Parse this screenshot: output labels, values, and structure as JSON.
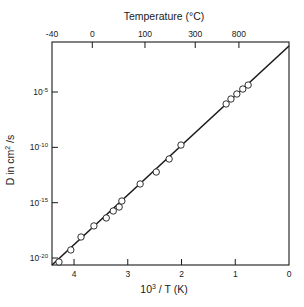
{
  "chart_data": {
    "type": "scatter",
    "title": "",
    "xlabel": "10³ / T (K)",
    "xlabel_base": "10",
    "xlabel_exp": "3",
    "xlabel_rest": " / T (K)",
    "ylabel": "D in cm² /s",
    "ylabel_pre": "D in cm",
    "ylabel_exp": "2",
    "ylabel_post": " /s",
    "top_axis_title": "Temperature (°C)",
    "xlim": [
      4.41,
      0
    ],
    "ylim_log10": [
      -20.63,
      -0.48
    ],
    "yscale": "log",
    "grid": false,
    "legend": null,
    "x_ticks": [
      {
        "value": 4,
        "label": "4"
      },
      {
        "value": 3,
        "label": "3"
      },
      {
        "value": 2,
        "label": "2"
      },
      {
        "value": 1,
        "label": "1"
      },
      {
        "value": 0,
        "label": "0"
      }
    ],
    "y_ticks": [
      {
        "log10": -5,
        "base": "10",
        "exp": "-5"
      },
      {
        "log10": -10,
        "base": "10",
        "exp": "-10"
      },
      {
        "log10": -15,
        "base": "10",
        "exp": "-15"
      },
      {
        "log10": -20,
        "base": "10",
        "exp": "-20"
      }
    ],
    "top_ticks": [
      {
        "celsius": -40,
        "x": 4.29,
        "label": "-40"
      },
      {
        "celsius": 0,
        "x": 3.66,
        "label": "0"
      },
      {
        "celsius": 100,
        "x": 2.68,
        "label": "100"
      },
      {
        "celsius": 300,
        "x": 1.745,
        "label": "300"
      },
      {
        "celsius": 800,
        "x": 0.932,
        "label": "800"
      }
    ],
    "series": [
      {
        "name": "measured",
        "marker": "open-circle",
        "points": [
          {
            "x": 4.28,
            "log10_y": -20.36
          },
          {
            "x": 4.06,
            "log10_y": -19.27
          },
          {
            "x": 3.87,
            "log10_y": -18.1
          },
          {
            "x": 3.63,
            "log10_y": -17.1
          },
          {
            "x": 3.4,
            "log10_y": -16.38
          },
          {
            "x": 3.27,
            "log10_y": -15.75
          },
          {
            "x": 3.16,
            "log10_y": -15.39
          },
          {
            "x": 3.11,
            "log10_y": -14.85
          },
          {
            "x": 2.77,
            "log10_y": -13.31
          },
          {
            "x": 2.47,
            "log10_y": -12.23
          },
          {
            "x": 2.23,
            "log10_y": -11.05
          },
          {
            "x": 2.01,
            "log10_y": -9.79
          },
          {
            "x": 1.17,
            "log10_y": -6.08
          },
          {
            "x": 1.08,
            "log10_y": -5.63
          },
          {
            "x": 0.97,
            "log10_y": -5.18
          },
          {
            "x": 0.86,
            "log10_y": -4.73
          },
          {
            "x": 0.76,
            "log10_y": -4.37
          }
        ]
      },
      {
        "name": "fit",
        "type": "line",
        "points": [
          {
            "x": 4.41,
            "log10_y": -20.63
          },
          {
            "x": 0.0,
            "log10_y": -0.84
          }
        ]
      }
    ]
  }
}
